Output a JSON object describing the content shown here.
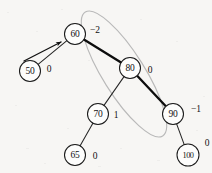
{
  "figure": {
    "background_color": "#f7f6f4",
    "ink_color": "#111111",
    "highlight_color": "#b9b9b9"
  },
  "nodes": [
    {
      "id": "n60",
      "value": "60",
      "balance": "−2",
      "cx": 75,
      "cy": 34,
      "r": 10.5,
      "bf_x": 95,
      "bf_y": 30,
      "wide": false
    },
    {
      "id": "n50",
      "value": "50",
      "balance": "0",
      "cx": 30,
      "cy": 71,
      "r": 10.5,
      "bf_x": 49,
      "bf_y": 69,
      "wide": false
    },
    {
      "id": "n80",
      "value": "80",
      "balance": "0",
      "cx": 130,
      "cy": 68,
      "r": 10.5,
      "bf_x": 150,
      "bf_y": 70,
      "wide": false
    },
    {
      "id": "n70",
      "value": "70",
      "balance": "1",
      "cx": 98,
      "cy": 114,
      "r": 10.5,
      "bf_x": 116,
      "bf_y": 115,
      "wide": false
    },
    {
      "id": "n90",
      "value": "90",
      "balance": "−1",
      "cx": 173,
      "cy": 114,
      "r": 10.5,
      "bf_x": 196,
      "bf_y": 109,
      "wide": false
    },
    {
      "id": "n65",
      "value": "65",
      "balance": "0",
      "cx": 75,
      "cy": 155,
      "r": 10.5,
      "bf_x": 95,
      "bf_y": 156,
      "wide": false
    },
    {
      "id": "n100",
      "value": "100",
      "balance": "0",
      "cx": 188,
      "cy": 155,
      "r": 11.0,
      "bf_x": 207,
      "bf_y": 143,
      "wide": true
    }
  ],
  "edges": [
    {
      "id": "e60-50",
      "from": "n60",
      "to": "n50",
      "weight": "thin"
    },
    {
      "id": "e60-80",
      "from": "n60",
      "to": "n80",
      "weight": "bold"
    },
    {
      "id": "e80-70",
      "from": "n80",
      "to": "n70",
      "weight": "thin"
    },
    {
      "id": "e80-90",
      "from": "n80",
      "to": "n90",
      "weight": "bold"
    },
    {
      "id": "e70-65",
      "from": "n70",
      "to": "n65",
      "weight": "thin"
    },
    {
      "id": "e90-100",
      "from": "n90",
      "to": "n100",
      "weight": "thin"
    }
  ],
  "highlight": {
    "label": "subtree-highlight-ellipse",
    "cx": 124,
    "cy": 74,
    "rx": 21,
    "ry": 73,
    "rotation": -32
  },
  "pointer": {
    "label": "insertion-pointer-arrow",
    "x1": 24,
    "y1": 61,
    "x2": 61,
    "y2": 42
  }
}
